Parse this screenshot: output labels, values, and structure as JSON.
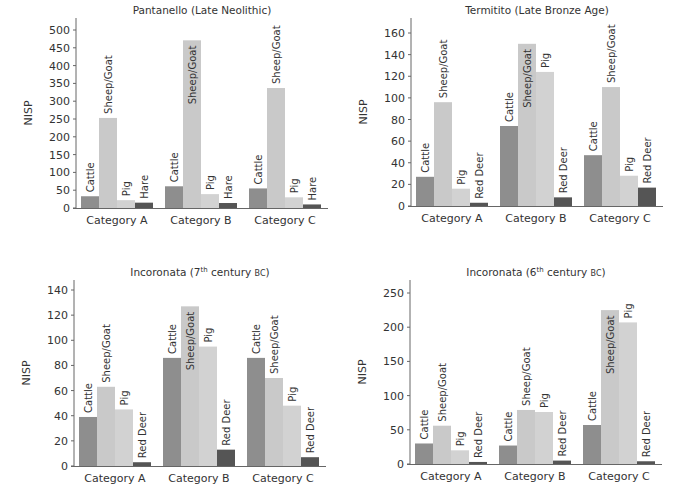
{
  "chart_data": [
    {
      "type": "bar",
      "title": "Pantanello (Late Neolithic)",
      "title_parts": {
        "main": "Pantanello (Late Neolithic)",
        "sup": "",
        "tail": ""
      },
      "xlabel": "",
      "ylabel": "NISP",
      "ylim": [
        0,
        500
      ],
      "yticks": [
        0,
        50,
        100,
        150,
        200,
        250,
        300,
        350,
        400,
        450,
        500
      ],
      "grid": false,
      "legend": "none (bar labels rotated above bars)",
      "categories": [
        "Category A",
        "Category B",
        "Category C"
      ],
      "series": [
        {
          "name": "Cattle",
          "color": "#8e8e8e",
          "values": [
            33,
            61,
            55
          ]
        },
        {
          "name": "Sheep/Goat",
          "color": "#c9c9c9",
          "values": [
            253,
            471,
            337
          ]
        },
        {
          "name": "Pig",
          "color": "#d2d2d2",
          "values": [
            22,
            39,
            30
          ]
        },
        {
          "name": "Hare",
          "color": "#555555",
          "values": [
            15,
            14,
            10
          ]
        }
      ]
    },
    {
      "type": "bar",
      "title": "Termitito (Late Bronze Age)",
      "title_parts": {
        "main": "Termitito (Late Bronze Age)",
        "sup": "",
        "tail": ""
      },
      "xlabel": "",
      "ylabel": "NISP",
      "ylim": [
        0,
        170
      ],
      "yticks": [
        0,
        20,
        40,
        60,
        80,
        100,
        120,
        140,
        160
      ],
      "grid": false,
      "legend": "none (bar labels rotated above bars)",
      "categories": [
        "Category A",
        "Category B",
        "Category C"
      ],
      "series": [
        {
          "name": "Cattle",
          "color": "#8e8e8e",
          "values": [
            27,
            74,
            47
          ]
        },
        {
          "name": "Sheep/Goat",
          "color": "#c9c9c9",
          "values": [
            96,
            150,
            110
          ]
        },
        {
          "name": "Pig",
          "color": "#d2d2d2",
          "values": [
            16,
            124,
            28
          ]
        },
        {
          "name": "Red Deer",
          "color": "#555555",
          "values": [
            3,
            8,
            17
          ]
        }
      ]
    },
    {
      "type": "bar",
      "title": "Incoronata (7th century BC)",
      "title_parts": {
        "main": "Incoronata (7",
        "sup": "th",
        "tail": " century BC)"
      },
      "xlabel": "",
      "ylabel": "NISP",
      "ylim": [
        0,
        145
      ],
      "yticks": [
        0,
        20,
        40,
        60,
        80,
        100,
        120,
        140
      ],
      "grid": false,
      "legend": "none (bar labels rotated above bars)",
      "categories": [
        "Category A",
        "Category B",
        "Category C"
      ],
      "series": [
        {
          "name": "Cattle",
          "color": "#8e8e8e",
          "values": [
            39,
            86,
            86
          ]
        },
        {
          "name": "Sheep/Goat",
          "color": "#c9c9c9",
          "values": [
            63,
            127,
            70
          ]
        },
        {
          "name": "Pig",
          "color": "#d2d2d2",
          "values": [
            45,
            95,
            48
          ]
        },
        {
          "name": "Red Deer",
          "color": "#555555",
          "values": [
            3,
            13,
            7
          ]
        }
      ]
    },
    {
      "type": "bar",
      "title": "Incoronata (6th century BC)",
      "title_parts": {
        "main": "Incoronata (6",
        "sup": "th",
        "tail": " century BC)"
      },
      "xlabel": "",
      "ylabel": "NISP",
      "ylim": [
        0,
        270
      ],
      "yticks": [
        0,
        50,
        100,
        150,
        200,
        250
      ],
      "grid": false,
      "legend": "none (bar labels rotated above bars)",
      "categories": [
        "Category A",
        "Category B",
        "Category C"
      ],
      "series": [
        {
          "name": "Cattle",
          "color": "#8e8e8e",
          "values": [
            30,
            27,
            57
          ]
        },
        {
          "name": "Sheep/Goat",
          "color": "#c9c9c9",
          "values": [
            56,
            79,
            225
          ]
        },
        {
          "name": "Pig",
          "color": "#d2d2d2",
          "values": [
            20,
            76,
            207
          ]
        },
        {
          "name": "Red Deer",
          "color": "#555555",
          "values": [
            3,
            5,
            4
          ]
        }
      ]
    }
  ],
  "layout": {
    "panels": [
      {
        "left": 0,
        "top": 0,
        "axisX": 76,
        "axisTop": 18,
        "baseY": 208,
        "plotRight": 328,
        "yMaxTick": 500,
        "yMaxTickY": 30
      },
      {
        "left": 0,
        "top": 0,
        "axisX": 411,
        "axisTop": 18,
        "baseY": 206,
        "plotRight": 663,
        "yMaxTick": 160,
        "yMaxTickY": 33
      },
      {
        "left": 0,
        "top": 0,
        "axisX": 74,
        "axisTop": 280,
        "baseY": 466,
        "plotRight": 326,
        "yMaxTick": 140,
        "yMaxTickY": 290
      },
      {
        "left": 0,
        "top": 0,
        "axisX": 410,
        "axisTop": 280,
        "baseY": 464,
        "plotRight": 662,
        "yMaxTick": 250,
        "yMaxTickY": 293
      }
    ]
  }
}
